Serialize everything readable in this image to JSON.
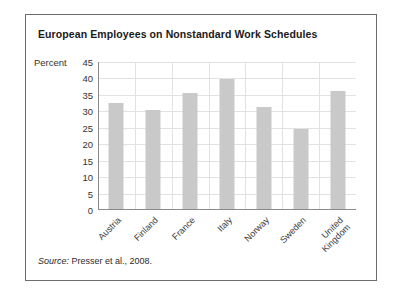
{
  "figure": {
    "title": "European Employees on Nonstandard Work Schedules",
    "axis_unit_label": "Percent",
    "source_lead": "Source:",
    "source_text": " Presser et al., 2008."
  },
  "colors": {
    "bar": "#c9c9c9",
    "gridline": "#e2e2e2",
    "axis": "#8a8a8a",
    "frame": "#6d6d6d",
    "title_text": "#1a1a1a",
    "background": "#ffffff"
  },
  "chart_data": {
    "type": "bar",
    "title": "European Employees on Nonstandard Work Schedules",
    "xlabel": "",
    "ylabel": "Percent",
    "ylim": [
      0,
      45
    ],
    "ytick_step": 5,
    "yticks": [
      45,
      40,
      35,
      30,
      25,
      20,
      15,
      10,
      5,
      0
    ],
    "ytick_labels": [
      "45",
      "40",
      "35",
      "30",
      "25",
      "20",
      "15",
      "10",
      "5",
      "0"
    ],
    "grid": true,
    "grid_axis": "both",
    "legend": false,
    "categories": [
      "Austria",
      "Finland",
      "France",
      "Italy",
      "Norway",
      "Sweden",
      "United Kingdom"
    ],
    "category_label_lines": [
      [
        "Austria"
      ],
      [
        "Finland"
      ],
      [
        "France"
      ],
      [
        "Italy"
      ],
      [
        "Norway"
      ],
      [
        "Sweden"
      ],
      [
        "United",
        "Kingdom"
      ]
    ],
    "values": [
      32.5,
      30.5,
      35.5,
      39.8,
      31.3,
      24.5,
      36.2
    ],
    "source": "Presser et al., 2008."
  }
}
